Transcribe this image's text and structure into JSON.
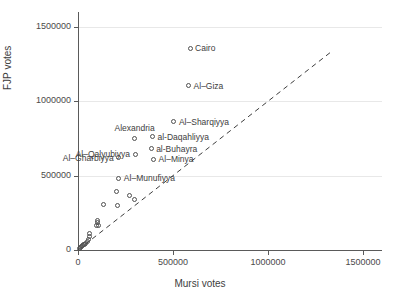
{
  "chart_data": {
    "type": "scatter",
    "title": "",
    "xlabel": "Mursi votes",
    "ylabel": "FJP votes",
    "xlim": [
      0,
      1600000
    ],
    "ylim": [
      0,
      1600000
    ],
    "xticks": [
      0,
      500000,
      1000000,
      1500000
    ],
    "yticks": [
      0,
      500000,
      1000000,
      1500000
    ],
    "xtick_labels": [
      "0",
      "500000",
      "1000000",
      "1500000"
    ],
    "ytick_labels": [
      "0",
      "500000",
      "1000000",
      "1500000"
    ],
    "grid": "horizontal",
    "legend": "none",
    "marker": "open-circle",
    "reference_line": {
      "type": "dashed",
      "description": "45 degree line y = x",
      "x_start": 0,
      "y_start": 0,
      "x_end": 1330000,
      "y_end": 1330000
    },
    "labeled_points": [
      {
        "label": "Cairo",
        "x": 590000,
        "y": 1355000,
        "label_pos": "right"
      },
      {
        "label": "Al–Giza",
        "x": 582000,
        "y": 1105000,
        "label_pos": "right"
      },
      {
        "label": "Al–Sharqiyya",
        "x": 505000,
        "y": 862000,
        "label_pos": "right"
      },
      {
        "label": "al-Daqahliyya",
        "x": 392000,
        "y": 762000,
        "label_pos": "right"
      },
      {
        "label": "Alexandria",
        "x": 298000,
        "y": 752000,
        "label_pos": "above"
      },
      {
        "label": "al-Buhayra",
        "x": 385000,
        "y": 682000,
        "label_pos": "right"
      },
      {
        "label": "Al–Qalyubiyya",
        "x": 300000,
        "y": 645000,
        "label_pos": "left"
      },
      {
        "label": "Al–Minya",
        "x": 398000,
        "y": 610000,
        "label_pos": "right"
      },
      {
        "label": "Al–Gharbiyya",
        "x": 215000,
        "y": 620000,
        "label_pos": "left"
      },
      {
        "label": "Al–Munufiyya",
        "x": 215000,
        "y": 482000,
        "label_pos": "right"
      }
    ],
    "unlabeled_points": [
      {
        "x": 205000,
        "y": 392000
      },
      {
        "x": 272000,
        "y": 365000
      },
      {
        "x": 295000,
        "y": 338000
      },
      {
        "x": 135000,
        "y": 305000
      },
      {
        "x": 208000,
        "y": 298000
      },
      {
        "x": 100000,
        "y": 196000
      },
      {
        "x": 104000,
        "y": 182000
      },
      {
        "x": 98000,
        "y": 168000
      },
      {
        "x": 108000,
        "y": 162000
      },
      {
        "x": 62000,
        "y": 108000
      },
      {
        "x": 60000,
        "y": 88000
      },
      {
        "x": 55000,
        "y": 72000
      },
      {
        "x": 48000,
        "y": 58000
      },
      {
        "x": 40000,
        "y": 46000
      },
      {
        "x": 34000,
        "y": 40000
      },
      {
        "x": 28000,
        "y": 34000
      },
      {
        "x": 22000,
        "y": 28000
      },
      {
        "x": 18000,
        "y": 22000
      },
      {
        "x": 12000,
        "y": 16000
      },
      {
        "x": 8000,
        "y": 12000
      }
    ]
  },
  "colors": {
    "marker_stroke": "#4f4f4f",
    "gridline": "#e8e8e8",
    "axis": "#5a5a5a",
    "text": "#3d3d3d",
    "background": "#ffffff"
  }
}
